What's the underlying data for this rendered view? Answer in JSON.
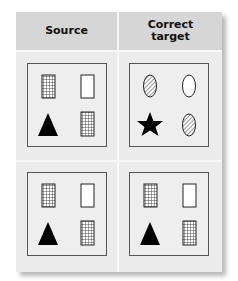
{
  "header": {
    "col1": "Source",
    "col2_line1": "Correct",
    "col2_line2": "target"
  },
  "rows": [
    {
      "source": [
        "grid-rect",
        "white-rect",
        "black-triangle",
        "grid-rect"
      ],
      "target": [
        "hatched-ellipse",
        "white-ellipse",
        "black-star",
        "hatched-ellipse"
      ]
    },
    {
      "source": [
        "grid-rect",
        "white-rect",
        "black-triangle",
        "grid-rect"
      ],
      "target": [
        "grid-rect",
        "white-rect",
        "black-triangle",
        "grid-rect"
      ]
    }
  ],
  "colors": {
    "header_bg": "#d6d6d6",
    "body_bg": "#ececec",
    "panel_border": "#555555",
    "shape_fill": "#000000"
  }
}
